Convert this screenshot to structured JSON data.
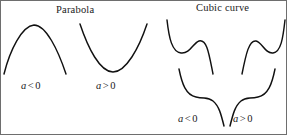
{
  "figure": {
    "width": 287,
    "height": 135,
    "background": "#ffffff",
    "stroke_color": "#111111",
    "border_color": "#6e6e6e"
  },
  "sections": {
    "parabola": {
      "title": "Parabola",
      "curves": [
        {
          "name": "parabola-concave-down",
          "label": {
            "variable": "a",
            "operator": "<",
            "value": "0"
          },
          "orientation": "opens-downward",
          "path": "M 4 74 C 10 50, 22 26, 34 25 C 46 25, 58 50, 66 74"
        },
        {
          "name": "parabola-concave-up",
          "label": {
            "variable": "a",
            "operator": ">",
            "value": "0"
          },
          "orientation": "opens-upward",
          "path": "M 80 24 C 88 48, 100 72, 113 72 C 126 72, 139 48, 147 24"
        }
      ]
    },
    "cubic": {
      "title": "Cubic curve",
      "curves": [
        {
          "name": "cubic-decreasing-upper-left",
          "orientation": "decreasing",
          "path": "M 167 20 C 169 38, 172 52, 181 53 C 190 54, 193 43, 199 41 C 207 39, 209 54, 213 74"
        },
        {
          "name": "cubic-increasing-upper-right",
          "orientation": "increasing",
          "path": "M 242 74 C 246 54, 249 40, 256 41 C 262 42, 265 54, 273 53 C 281 52, 283 38, 285 20"
        },
        {
          "name": "cubic-decreasing-lower-left",
          "orientation": "decreasing",
          "path": "M 179 69 C 182 84, 186 95, 196 97 C 205 99, 208 97, 213 101 C 219 106, 221 114, 224 126"
        },
        {
          "name": "cubic-increasing-lower-right",
          "orientation": "increasing",
          "path": "M 230 126 C 233 114, 235 106, 241 101 C 246 97, 249 99, 258 97 C 268 95, 272 84, 275 69"
        }
      ],
      "labels": [
        {
          "name": "cubic-negative",
          "variable": "a",
          "operator": "<",
          "value": "0"
        },
        {
          "name": "cubic-positive",
          "variable": "a",
          "operator": ">",
          "value": "0"
        }
      ]
    }
  }
}
